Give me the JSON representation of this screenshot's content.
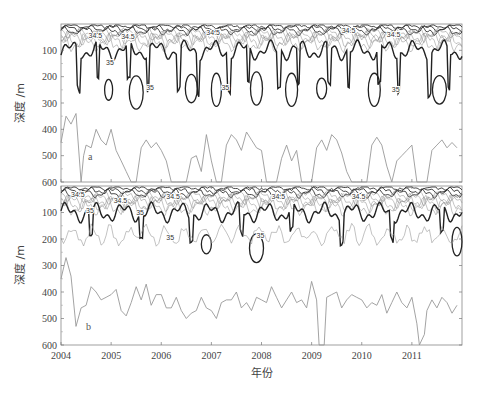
{
  "chart_data": [
    {
      "panel": "a",
      "type": "contour",
      "xlabel": "年份",
      "ylabel": "深度 /m",
      "xlim": [
        2004,
        2012
      ],
      "ylim": [
        600,
        0
      ],
      "xticks": [
        "2004",
        "2005",
        "2006",
        "2007",
        "2008",
        "2009",
        "2010",
        "2011"
      ],
      "yticks": [
        "100",
        "200",
        "300",
        "400",
        "500",
        "600"
      ],
      "contour_labels": [
        "34.5",
        "35"
      ],
      "highlighted_contour": 35,
      "overlay_line": {
        "description": "thin grey depth line (lower layer boundary)",
        "x": [
          2004.0,
          2004.1,
          2004.2,
          2004.3,
          2004.4,
          2004.45,
          2004.5,
          2004.6,
          2004.7,
          2004.8,
          2004.9,
          2005.0,
          2005.1,
          2005.2,
          2005.3,
          2005.4,
          2005.5,
          2005.6,
          2005.7,
          2005.8,
          2005.9,
          2006.0,
          2006.1,
          2006.2,
          2006.3,
          2006.4,
          2006.5,
          2006.6,
          2006.7,
          2006.8,
          2006.9,
          2007.0,
          2007.1,
          2007.2,
          2007.3,
          2007.4,
          2007.5,
          2007.6,
          2007.7,
          2007.8,
          2007.9,
          2008.0,
          2008.1,
          2008.2,
          2008.3,
          2008.4,
          2008.5,
          2008.6,
          2008.7,
          2008.8,
          2008.9,
          2009.0,
          2009.1,
          2009.2,
          2009.3,
          2009.4,
          2009.5,
          2009.6,
          2009.7,
          2009.8,
          2009.9,
          2010.0,
          2010.1,
          2010.2,
          2010.3,
          2010.4,
          2010.5,
          2010.6,
          2010.7,
          2010.8,
          2010.9,
          2011.0,
          2011.1,
          2011.2,
          2011.3,
          2011.4,
          2011.5,
          2011.6,
          2011.7,
          2011.8,
          2011.9
        ],
        "depth": [
          450,
          350,
          380,
          340,
          600,
          500,
          460,
          470,
          400,
          440,
          460,
          400,
          480,
          520,
          560,
          600,
          600,
          470,
          440,
          470,
          450,
          480,
          520,
          600,
          600,
          600,
          600,
          510,
          500,
          560,
          420,
          520,
          600,
          600,
          460,
          420,
          440,
          480,
          410,
          440,
          470,
          480,
          600,
          600,
          600,
          510,
          460,
          520,
          480,
          600,
          600,
          600,
          470,
          440,
          480,
          420,
          440,
          490,
          560,
          600,
          600,
          600,
          600,
          460,
          430,
          460,
          540,
          600,
          520,
          500,
          480,
          460,
          600,
          600,
          600,
          480,
          460,
          440,
          470,
          450,
          470
        ]
      }
    },
    {
      "panel": "b",
      "type": "contour",
      "xlabel": "年份",
      "ylabel": "深度 /m",
      "xlim": [
        2004,
        2012
      ],
      "ylim": [
        600,
        0
      ],
      "xticks": [
        "2004",
        "2005",
        "2006",
        "2007",
        "2008",
        "2009",
        "2010",
        "2011"
      ],
      "yticks": [
        "100",
        "200",
        "300",
        "400",
        "500",
        "600"
      ],
      "contour_labels": [
        "34.5",
        "35"
      ],
      "highlighted_contour": 35,
      "overlay_line": {
        "description": "thin grey depth line (lower layer boundary)",
        "x": [
          2004.0,
          2004.1,
          2004.2,
          2004.3,
          2004.4,
          2004.5,
          2004.6,
          2004.7,
          2004.8,
          2004.9,
          2005.0,
          2005.1,
          2005.2,
          2005.3,
          2005.4,
          2005.5,
          2005.6,
          2005.7,
          2005.8,
          2005.9,
          2006.0,
          2006.1,
          2006.2,
          2006.3,
          2006.4,
          2006.5,
          2006.6,
          2006.7,
          2006.8,
          2006.9,
          2007.0,
          2007.1,
          2007.2,
          2007.3,
          2007.4,
          2007.5,
          2007.6,
          2007.7,
          2007.8,
          2007.9,
          2008.0,
          2008.1,
          2008.2,
          2008.3,
          2008.4,
          2008.5,
          2008.6,
          2008.7,
          2008.8,
          2008.9,
          2009.0,
          2009.1,
          2009.15,
          2009.25,
          2009.3,
          2009.4,
          2009.5,
          2009.6,
          2009.7,
          2009.8,
          2009.9,
          2010.0,
          2010.1,
          2010.2,
          2010.3,
          2010.4,
          2010.5,
          2010.6,
          2010.7,
          2010.8,
          2010.9,
          2011.0,
          2011.1,
          2011.15,
          2011.25,
          2011.3,
          2011.4,
          2011.5,
          2011.6,
          2011.7,
          2011.8,
          2011.9
        ],
        "depth": [
          350,
          270,
          340,
          530,
          460,
          450,
          380,
          400,
          430,
          420,
          410,
          390,
          470,
          490,
          440,
          380,
          430,
          370,
          450,
          410,
          410,
          460,
          460,
          420,
          470,
          500,
          480,
          470,
          420,
          460,
          470,
          500,
          440,
          430,
          430,
          400,
          460,
          440,
          470,
          420,
          430,
          440,
          380,
          420,
          460,
          430,
          400,
          440,
          430,
          460,
          360,
          430,
          600,
          600,
          420,
          410,
          400,
          460,
          430,
          410,
          420,
          430,
          460,
          440,
          450,
          410,
          480,
          440,
          400,
          440,
          460,
          420,
          520,
          600,
          560,
          470,
          430,
          460,
          420,
          440,
          480,
          450
        ]
      }
    }
  ],
  "figure": {
    "panel_a_label": "a",
    "panel_b_label": "b",
    "x_axis_title": "年份",
    "y_axis_title_a": "深度 /m",
    "y_axis_title_b": "深度 /m",
    "xticks": [
      "2004",
      "2005",
      "2006",
      "2007",
      "2008",
      "2009",
      "2010",
      "2011"
    ],
    "yticks": [
      "100",
      "200",
      "300",
      "400",
      "500",
      "600"
    ],
    "contour_label_low": "34.5",
    "contour_label_high": "35",
    "colors": {
      "contour_thick": "#222222",
      "contour_thin": "#777777",
      "overlay_line": "#999999",
      "axis": "#666666"
    }
  }
}
